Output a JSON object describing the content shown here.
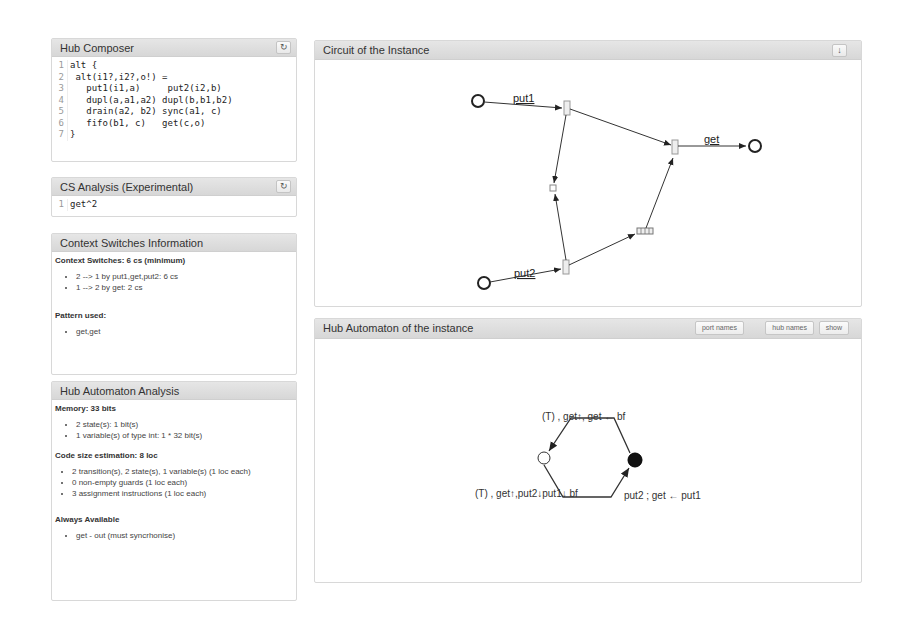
{
  "hub_composer": {
    "title": "Hub Composer",
    "refresh_icon": "↻",
    "lines": [
      {
        "n": "1",
        "text": "alt {"
      },
      {
        "n": "2",
        "text": " alt(i1?,i2?,o!) ="
      },
      {
        "n": "3",
        "text": "   put1(i1,a)     put2(i2,b)"
      },
      {
        "n": "4",
        "text": "   dupl(a,a1,a2) dupl(b,b1,b2)"
      },
      {
        "n": "5",
        "text": "   drain(a2, b2) sync(a1, c)"
      },
      {
        "n": "6",
        "text": "   fifo(b1, c)   get(c,o)"
      },
      {
        "n": "7",
        "text": "}"
      }
    ]
  },
  "cs_analysis": {
    "title": "CS Analysis (Experimental)",
    "refresh_icon": "↻",
    "lines": [
      {
        "n": "1",
        "text": "get^2"
      }
    ]
  },
  "context_switches": {
    "title": "Context Switches Information",
    "heading": "Context Switches: 6 cs (minimum)",
    "items": [
      "2 --> 1 by put1,get,put2: 6 cs",
      "1 --> 2 by get: 2 cs"
    ],
    "pattern_heading": "Pattern used:",
    "pattern_items": [
      "get,get"
    ]
  },
  "hub_automaton_analysis": {
    "title": "Hub Automaton Analysis",
    "memory_heading": "Memory: 33 bits",
    "memory_items": [
      "2 state(s): 1 bit(s)",
      "1 variable(s) of type int: 1 * 32 bit(s)"
    ],
    "code_heading": "Code size estimation: 8 loc",
    "code_items": [
      "2 transition(s), 2 state(s), 1 variable(s) (1 loc each)",
      "0 non-empty guards (1 loc each)",
      "3 assignment instructions (1 loc each)"
    ],
    "always_heading": "Always Available",
    "always_items": [
      "get - out (must syncrhonise)"
    ]
  },
  "circuit": {
    "title": "Circuit of the Instance",
    "download_icon": "↓",
    "labels": {
      "put1": "put1",
      "put2": "put2",
      "get": "get"
    }
  },
  "hub_automaton": {
    "title": "Hub Automaton of the instance",
    "buttons": {
      "port_names": "port names",
      "hub_names": "hub names",
      "show": "show"
    },
    "top_label": "(T)  , get↑, get ← bf",
    "bottom_left_label": "(T) , get↑,put2↓put1↓ bf",
    "bottom_right_label": "put2 ; get ← put1"
  }
}
